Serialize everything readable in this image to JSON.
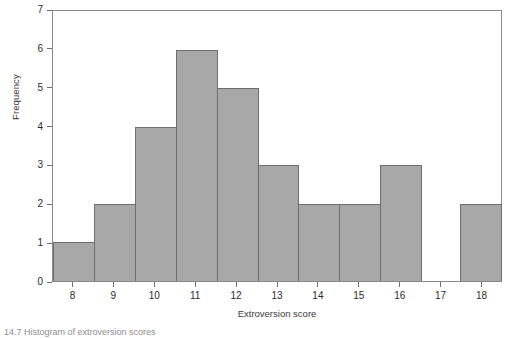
{
  "chart_data": {
    "type": "bar",
    "title": "",
    "xlabel": "Extroversion score",
    "ylabel": "Frequency",
    "categories": [
      "8",
      "9",
      "10",
      "11",
      "12",
      "13",
      "14",
      "15",
      "16",
      "17",
      "18"
    ],
    "values": [
      1,
      2,
      4,
      6,
      5,
      3,
      2,
      2,
      3,
      0,
      2
    ],
    "xlim": [
      7.5,
      18.5
    ],
    "ylim": [
      0,
      7
    ],
    "yticks": [
      0,
      1,
      2,
      3,
      4,
      5,
      6,
      7
    ],
    "xticks": [
      "8",
      "9",
      "10",
      "11",
      "12",
      "13",
      "14",
      "15",
      "16",
      "17",
      "18"
    ],
    "grid": false,
    "legend": false,
    "bar_fill": "#a8a8a8",
    "bar_stroke": "#6e6e6e",
    "frame_color": "#8a8a8a"
  },
  "caption": {
    "text": "14.7 Histogram of extroversion scores"
  }
}
